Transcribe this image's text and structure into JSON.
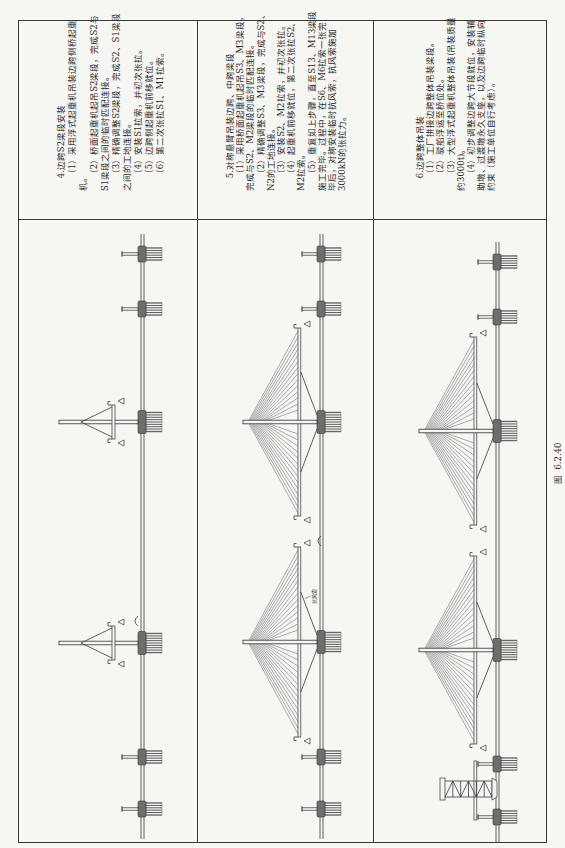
{
  "colors": {
    "ink": "#2b2b2b",
    "paper": "#f6f6f3",
    "rule": "#3a3a3a"
  },
  "figure": {
    "caption": "图  6.2.40"
  },
  "rows": [
    {
      "step": 4,
      "description": {
        "title": "4.边跨S2梁段安装",
        "lines": [
          "（1）采用浮式起重机吊装边跨侧桥起重",
          "机。",
          "（2）桥面起重机起吊S2梁段，完成S2与",
          "S1梁段之间的临时匹配连接。",
          "（3）精确调整S2梁段，完成S2、S1梁段",
          "之间的工地连接。",
          "（4）安装S1拉索，并初次张拉。",
          "（5）边跨侧起重机前移就位。",
          "（6）第二次张拉S1、M1拉索。"
        ]
      },
      "diagram": {
        "water_line": {
          "x1": 3,
          "x2": 608,
          "y": 122
        },
        "deck_y": 100,
        "pier_top_y": 103,
        "piers": [
          33,
          85,
          533,
          588
        ],
        "towers": [
          {
            "x": 199,
            "top_y": 40
          },
          {
            "x": 420,
            "top_y": 40
          }
        ],
        "pier_tables": [
          {
            "tower_x": 199,
            "half_width": 17,
            "apex_y": 62,
            "y": 93
          },
          {
            "tower_x": 420,
            "half_width": 17,
            "apex_y": 62,
            "y": 93
          }
        ],
        "markers": [
          {
            "x": 221,
            "y": 117
          }
        ]
      }
    },
    {
      "step": 5,
      "description": {
        "title": "5.对称悬臂吊装边跨、中跨梁段",
        "lines": [
          "（1）采用桥面起重机起吊S3、M3梁段，",
          "完成与S2、M2梁段的临时匹配连接。",
          "（2）精确调整S3、M3梁段，完成与S2、",
          "N2的工地连接。",
          "（3）安装S2、M2拉索，并初次张拉。",
          "（4）起重机前移就位，第二次张拉S2、",
          "M2拉索。",
          "（5）重复如上步骤，直至S13、M13梁段",
          "施工完毕。过程中，在S6、M6拉索一张完",
          "毕后，对称安装临时抗风索，抗风索施加",
          "3000kN的张拉力。"
        ]
      },
      "diagram": {
        "water_line": {
          "x1": 3,
          "x2": 608,
          "y": 122
        },
        "deck_y": 100,
        "pier_top_y": 104,
        "piers": [
          33,
          85,
          533,
          588
        ],
        "towers": [
          {
            "x": 200,
            "top_y": 45
          },
          {
            "x": 420,
            "top_y": 45
          }
        ],
        "girders": [
          {
            "x1": 105,
            "x2": 295
          },
          {
            "x1": 326,
            "x2": 514
          }
        ],
        "cable_fans": [
          {
            "tower_x": 200,
            "count": 14,
            "inner": 12,
            "outer": 92,
            "anchor_top": 50,
            "anchor_bottom": 66
          },
          {
            "tower_x": 420,
            "count": 14,
            "inner": 12,
            "outer": 91,
            "anchor_top": 50,
            "anchor_bottom": 66
          }
        ],
        "wind_cables": [
          {
            "tower_x": 200,
            "deck_offset": 50,
            "base_offset": 7
          },
          {
            "tower_x": 420,
            "deck_offset": 50,
            "base_offset": 7
          }
        ],
        "deck_cranes": [
          {
            "x": 105,
            "dir": -1
          },
          {
            "x": 295,
            "dir": 1
          },
          {
            "x": 326,
            "dir": -1
          },
          {
            "x": 514,
            "dir": 1
          }
        ],
        "annotations": [
          {
            "text": "抗风索",
            "x": 238,
            "y": 118,
            "leader": [
              246,
              112.5,
              243.5,
              107
            ]
          }
        ],
        "markers": [
          {
            "x": 301,
            "y": 121
          }
        ]
      }
    },
    {
      "step": 6,
      "description": {
        "title": "6.边跨整体吊装",
        "lines": [
          "（1）工厂拼接边跨整体吊装梁段。",
          "（2）驳船浮运至桥位处。",
          "（3）大型浮式起重机整体吊装(吊装质量",
          "约3000t)。",
          "（4）初步调整边跨大节段就位，安装辅",
          "助墩、过渡墩永久支座，以及边跨临时纵向",
          "约束（施工单位自行考虑）。"
        ]
      },
      "diagram": {
        "water_line": {
          "x1": 0,
          "x2": 600,
          "y": 122
        },
        "deck_y": 100,
        "pier_top_y": 104,
        "piers": [
          25,
          78,
          525,
          580
        ],
        "towers": [
          {
            "x": 192,
            "top_y": 45
          },
          {
            "x": 411,
            "top_y": 45
          }
        ],
        "girders": [
          {
            "x1": 98,
            "x2": 286,
            "kind": "main-girder"
          },
          {
            "x1": 317,
            "x2": 505,
            "kind": "main-girder"
          },
          {
            "x1": 22,
            "x2": 81,
            "kind": "side-span-segment"
          }
        ],
        "cable_fans": [
          {
            "tower_x": 192,
            "count": 14,
            "inner": 12,
            "outer": 91,
            "anchor_top": 50,
            "anchor_bottom": 66
          },
          {
            "tower_x": 411,
            "count": 14,
            "inner": 12,
            "outer": 91,
            "anchor_top": 50,
            "anchor_bottom": 66
          }
        ],
        "wind_cables": [
          {
            "tower_x": 192,
            "deck_offset": 48,
            "base_offset": 7
          },
          {
            "tower_x": 411,
            "deck_offset": 48,
            "base_offset": 7
          }
        ],
        "deck_cranes": [
          {
            "x": 98,
            "dir": -1
          },
          {
            "x": 286,
            "dir": 1
          },
          {
            "x": 317,
            "dir": -1
          },
          {
            "x": 505,
            "dir": 1
          }
        ],
        "floating_crane": {
          "x": 53,
          "top_y": 66
        }
      }
    }
  ]
}
